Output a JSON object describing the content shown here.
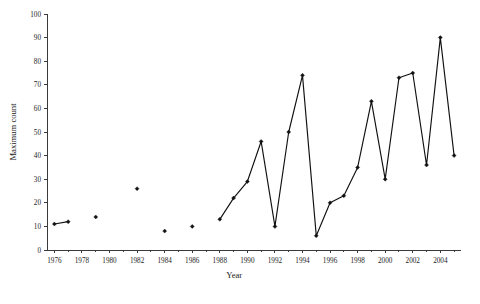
{
  "chart_data": {
    "type": "line",
    "title": "",
    "xlabel": "Year",
    "ylabel": "Maximum count",
    "xlim": [
      1975.5,
      2005.5
    ],
    "ylim": [
      0,
      100
    ],
    "grid": false,
    "legend": null,
    "x_tick_labels": [
      "1976",
      "1978",
      "1980",
      "1982",
      "1984",
      "1986",
      "1988",
      "1990",
      "1992",
      "1994",
      "1996",
      "1998",
      "2000",
      "2002",
      "2004"
    ],
    "x_tick_values": [
      1976,
      1978,
      1980,
      1982,
      1984,
      1986,
      1988,
      1990,
      1992,
      1994,
      1996,
      1998,
      2000,
      2002,
      2004
    ],
    "x_minor_tick_values": [
      1977,
      1979,
      1981,
      1983,
      1985,
      1987,
      1989,
      1991,
      1993,
      1995,
      1997,
      1999,
      2001,
      2003,
      2005
    ],
    "y_tick_labels": [
      "0",
      "10",
      "20",
      "30",
      "40",
      "50",
      "60",
      "70",
      "80",
      "90",
      "100"
    ],
    "y_tick_values": [
      0,
      10,
      20,
      30,
      40,
      50,
      60,
      70,
      80,
      90,
      100
    ],
    "series": [
      {
        "name": "Maximum count",
        "marker": "diamond",
        "color": "#111111",
        "segments": [
          {
            "x": [
              1976,
              1977
            ],
            "y": [
              11,
              12
            ]
          },
          {
            "x": [
              1979
            ],
            "y": [
              14
            ]
          },
          {
            "x": [
              1982
            ],
            "y": [
              26
            ]
          },
          {
            "x": [
              1984
            ],
            "y": [
              8
            ]
          },
          {
            "x": [
              1986
            ],
            "y": [
              10
            ]
          },
          {
            "x": [
              1988,
              1989,
              1990,
              1991,
              1992,
              1993,
              1994,
              1995,
              1996,
              1997,
              1998,
              1999,
              2000,
              2001,
              2002,
              2003,
              2004,
              2005
            ],
            "y": [
              13,
              22,
              29,
              46,
              10,
              50,
              74,
              6,
              20,
              23,
              35,
              63,
              30,
              73,
              75,
              36,
              90,
              40
            ]
          }
        ],
        "points": [
          {
            "x": 1976,
            "y": 11
          },
          {
            "x": 1977,
            "y": 12
          },
          {
            "x": 1979,
            "y": 14
          },
          {
            "x": 1982,
            "y": 26
          },
          {
            "x": 1984,
            "y": 8
          },
          {
            "x": 1986,
            "y": 10
          },
          {
            "x": 1988,
            "y": 13
          },
          {
            "x": 1989,
            "y": 22
          },
          {
            "x": 1990,
            "y": 29
          },
          {
            "x": 1991,
            "y": 46
          },
          {
            "x": 1992,
            "y": 10
          },
          {
            "x": 1993,
            "y": 50
          },
          {
            "x": 1994,
            "y": 74
          },
          {
            "x": 1995,
            "y": 6
          },
          {
            "x": 1996,
            "y": 20
          },
          {
            "x": 1997,
            "y": 23
          },
          {
            "x": 1998,
            "y": 35
          },
          {
            "x": 1999,
            "y": 63
          },
          {
            "x": 2000,
            "y": 30
          },
          {
            "x": 2001,
            "y": 73
          },
          {
            "x": 2002,
            "y": 75
          },
          {
            "x": 2003,
            "y": 36
          },
          {
            "x": 2004,
            "y": 90
          },
          {
            "x": 2005,
            "y": 40
          }
        ]
      }
    ]
  },
  "figure": {
    "caption_fragment": ""
  }
}
